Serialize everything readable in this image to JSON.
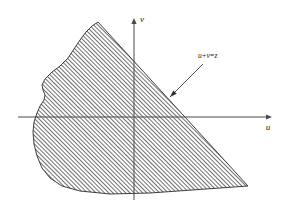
{
  "figure": {
    "kind": "math-diagram",
    "background_color": "#ffffff",
    "ink_color": "#2a2a2a",
    "axis_color": "#4a4a4a",
    "axes": {
      "horizontal": {
        "label": "u",
        "label_x": 268,
        "label_y": 130,
        "y": 117,
        "x_start": 18,
        "x_end": 272,
        "arrow": "right"
      },
      "vertical": {
        "label": "v",
        "label_x": 142,
        "label_y": 22,
        "x": 134,
        "y_start": 200,
        "y_end": 18,
        "arrow": "up"
      },
      "origin": {
        "x": 134,
        "y": 117
      }
    },
    "boundary_line": {
      "label": "u+v=z",
      "label_x": 198,
      "label_y": 58,
      "slope_sign": "negative",
      "from": {
        "x": 98,
        "y": 22
      },
      "to": {
        "x": 248,
        "y": 186
      }
    },
    "pointer": {
      "name": "leader-arrow",
      "from": {
        "x": 203,
        "y": 64
      },
      "to": {
        "x": 170,
        "y": 97
      }
    },
    "shaded_region": {
      "hatch_angle_deg": 45,
      "hatch_spacing_px": 2.1,
      "hatch_color": "#1a1a1a",
      "outline_color": "#2a2a2a",
      "path": "M 98 22 L 248 186 L 150 193 L 110 194 L 80 191 L 62 186 L 50 178 L 42 168 L 37 156 L 34 144 L 33 132 L 34 122 L 37 113 L 40 106 L 44 100 L 45 95 L 43 90 L 42 85 L 45 79 L 52 72 L 60 66 L 68 58 L 74 49 L 80 40 L 86 32 L 92 26 Z"
    }
  }
}
